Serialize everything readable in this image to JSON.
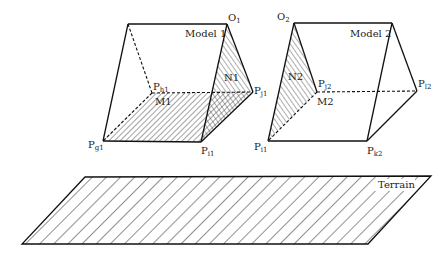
{
  "diagram": {
    "type": "3D geometry - stereo models over terrain",
    "models": [
      {
        "name": "Model 1",
        "label": "Model 1",
        "vertices": {
          "O1": {
            "label": "O",
            "sub": "1"
          },
          "Ph1": {
            "label": "P",
            "sub": "h1"
          },
          "Pj1": {
            "label": "P",
            "sub": "j1"
          },
          "Pg1": {
            "label": "P",
            "sub": "g1"
          },
          "Pi1": {
            "label": "P",
            "sub": "i1"
          }
        },
        "regions": [
          {
            "name": "M1",
            "label": "M1",
            "hatch": "backslash"
          },
          {
            "name": "N1",
            "label": "N1",
            "hatch": "slash"
          }
        ]
      },
      {
        "name": "Model 2",
        "label": "Model 2",
        "vertices": {
          "O2": {
            "label": "O",
            "sub": "2"
          },
          "Pj2": {
            "label": "P",
            "sub": "j2"
          },
          "Pl2": {
            "label": "P",
            "sub": "l2"
          },
          "Pi1": {
            "label": "P",
            "sub": "i1"
          },
          "Pk2": {
            "label": "P",
            "sub": "k2"
          }
        },
        "regions": [
          {
            "name": "M2",
            "label": "M2",
            "hatch": "none"
          },
          {
            "name": "N2",
            "label": "N2",
            "hatch": "slash"
          }
        ]
      }
    ],
    "terrain": {
      "label": "Terrain",
      "hatch": "backslash"
    }
  }
}
